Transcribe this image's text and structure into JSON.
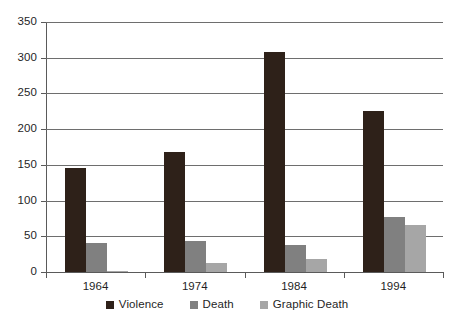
{
  "chart_data": {
    "type": "bar",
    "title": "",
    "subtitle": "",
    "xlabel": "",
    "ylabel": "",
    "categories": [
      "1964",
      "1974",
      "1984",
      "1994"
    ],
    "series": [
      {
        "name": "Violence",
        "color": "#2e2119",
        "values": [
          145,
          168,
          308,
          225
        ]
      },
      {
        "name": "Death",
        "color": "#808080",
        "values": [
          41,
          44,
          38,
          77
        ]
      },
      {
        "name": "Graphic Death",
        "color": "#a6a6a6",
        "values": [
          1,
          12,
          18,
          66
        ]
      }
    ],
    "ylim": [
      0,
      350
    ],
    "yticks": [
      0,
      50,
      100,
      150,
      200,
      250,
      300,
      350
    ],
    "ytick_labels": [
      "0",
      "50",
      "100",
      "150",
      "200",
      "250",
      "300",
      "350"
    ],
    "grid": true,
    "grid_axis": "y",
    "legend_position": "bottom",
    "legend_entries": [
      "Violence",
      "Death",
      "Graphic Death"
    ],
    "annotations": [],
    "background_color": "#ffffff",
    "axis_color": "#5a5a5a",
    "grid_color": "#6e6e6e"
  }
}
